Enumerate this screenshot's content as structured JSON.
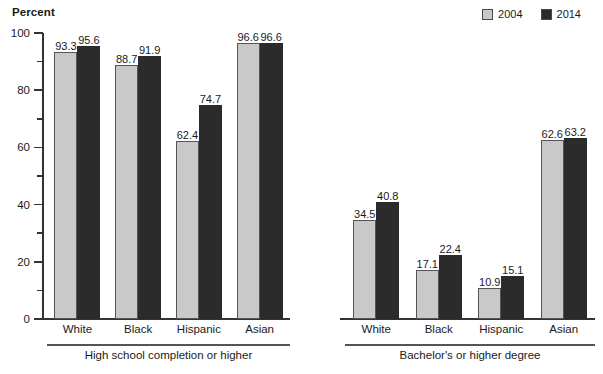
{
  "chart_data": {
    "type": "bar",
    "title": "",
    "xlabel": "",
    "ylabel": "Percent",
    "ylim": [
      0,
      100
    ],
    "ytick_labels": [
      "0",
      "20",
      "40",
      "60",
      "80",
      "100"
    ],
    "ytick_values": [
      0,
      20,
      40,
      60,
      80,
      100
    ],
    "minor_tick_values": [
      10,
      30,
      50,
      70,
      90
    ],
    "grid": false,
    "legend_position": "top-right",
    "legend": [
      "2004",
      "2014"
    ],
    "series": [
      {
        "name": "2004",
        "color": "#c9c9c9"
      },
      {
        "name": "2014",
        "color": "#2b2b2b"
      }
    ],
    "panels": [
      {
        "label": "High school completion or higher",
        "categories": [
          "White",
          "Black",
          "Hispanic",
          "Asian"
        ],
        "values_2004": [
          93.3,
          88.7,
          62.4,
          96.6
        ],
        "values_2014": [
          95.6,
          91.9,
          74.7,
          96.6
        ]
      },
      {
        "label": "Bachelor's or higher degree",
        "categories": [
          "White",
          "Black",
          "Hispanic",
          "Asian"
        ],
        "values_2004": [
          34.5,
          17.1,
          10.9,
          62.6
        ],
        "values_2014": [
          40.8,
          22.4,
          15.1,
          63.2
        ]
      }
    ]
  },
  "legend": {
    "items": [
      {
        "label": "2004",
        "swatch": "#c9c9c9"
      },
      {
        "label": "2014",
        "swatch": "#2b2b2b"
      }
    ]
  },
  "axis": {
    "y_title": "Percent"
  }
}
